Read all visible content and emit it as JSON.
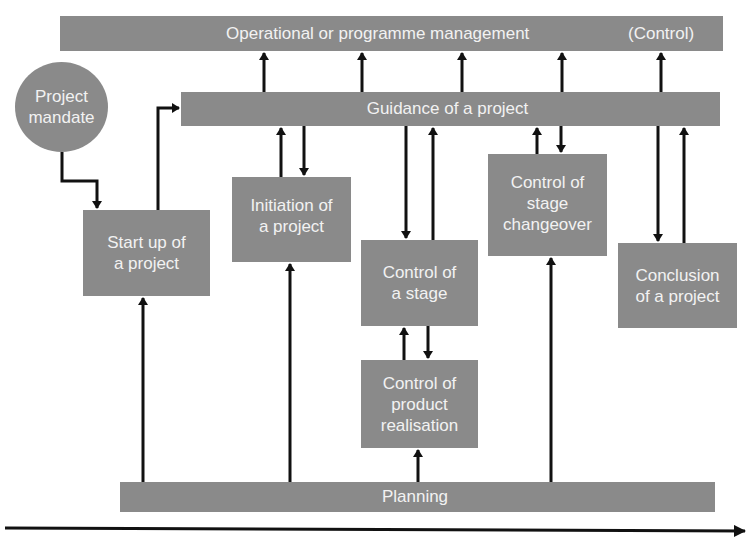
{
  "diagram": {
    "type": "process-flow",
    "colors": {
      "box_fill": "#8a8a8a",
      "text": "#f2f2f2",
      "arrow": "#111111",
      "background": "#ffffff"
    },
    "bars": {
      "operational": {
        "label": "Operational or programme management",
        "suffix": "(Control)"
      },
      "guidance": {
        "label": "Guidance of a project"
      },
      "planning": {
        "label": "Planning"
      }
    },
    "mandate": {
      "label": "Project\nmandate"
    },
    "processes": [
      {
        "id": "start-up",
        "label": "Start up of\na project"
      },
      {
        "id": "initiation",
        "label": "Initiation of\na project"
      },
      {
        "id": "control-stage",
        "label": "Control of\na stage"
      },
      {
        "id": "product-realisation",
        "label": "Control of\nproduct\nrealisation"
      },
      {
        "id": "stage-changeover",
        "label": "Control of\nstage\nchangeover"
      },
      {
        "id": "conclusion",
        "label": "Conclusion\nof a project"
      }
    ],
    "timeline": {
      "direction": "left-to-right"
    }
  }
}
